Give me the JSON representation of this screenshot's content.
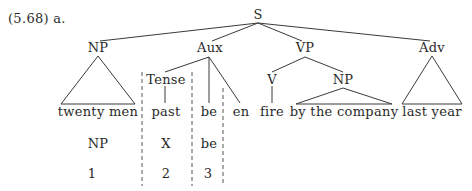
{
  "example_label": "(5.68) a.",
  "tree": {
    "root": "S",
    "nodes": {
      "np_subject": "NP",
      "aux": "Aux",
      "vp": "VP",
      "adv": "Adv",
      "tense": "Tense",
      "v": "V",
      "np_object": "NP"
    },
    "leaves": {
      "twenty_men": "twenty men",
      "past": "past",
      "be": "be",
      "en": "en",
      "fire": "fire",
      "by_the_company": "by the company",
      "last_year": "last year"
    }
  },
  "structural_description": {
    "terms": [
      "NP",
      "X",
      "be"
    ],
    "indices": [
      "1",
      "2",
      "3"
    ]
  },
  "colors": {
    "ink": "#2a2a2a",
    "line": "#3a3a3a",
    "dashed": "#555555",
    "background": "#ffffff"
  }
}
